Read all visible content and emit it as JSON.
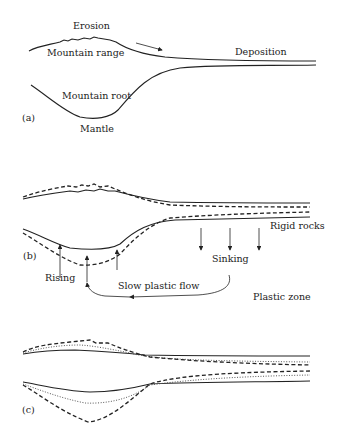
{
  "panels": {
    "a": {
      "label": "(a)",
      "erosion": "Erosion",
      "mountain_range": "Mountain range",
      "deposition": "Deposition",
      "mountain_root": "Mountain root",
      "mantle": "Mantle"
    },
    "b": {
      "label": "(b)",
      "rigid_rocks": "Rigid rocks",
      "sinking": "Sinking",
      "rising": "Rising",
      "slow_plastic_flow": "Slow plastic flow",
      "plastic_zone": "Plastic zone"
    },
    "c": {
      "label": "(c)"
    }
  },
  "legend_styles": {
    "solid": "original surface",
    "dashed": "stage 2",
    "dotted": "intermediate stage"
  }
}
